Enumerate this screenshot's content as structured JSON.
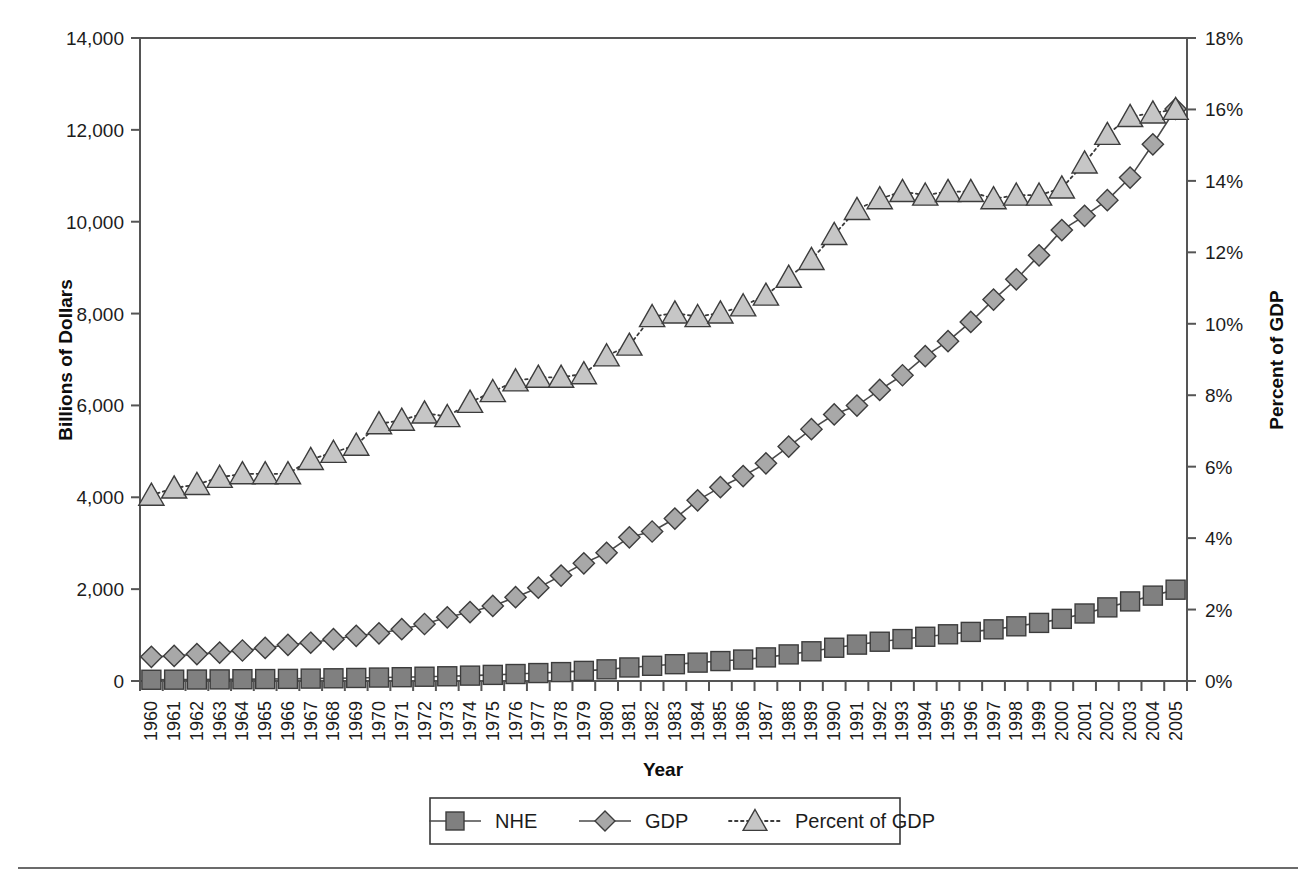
{
  "chart_data": {
    "type": "line",
    "title": "",
    "xlabel": "Year",
    "ylabel": "Billions of Dollars",
    "y2label": "Percent of GDP",
    "grid": false,
    "legend_position": "bottom",
    "ylim": [
      0,
      14000
    ],
    "y2lim": [
      0,
      18
    ],
    "yticks": [
      "0",
      "2,000",
      "4,000",
      "6,000",
      "8,000",
      "10,000",
      "12,000",
      "14,000"
    ],
    "ytick_values": [
      0,
      2000,
      4000,
      6000,
      8000,
      10000,
      12000,
      14000
    ],
    "y2ticks": [
      "0%",
      "2%",
      "4%",
      "6%",
      "8%",
      "10%",
      "12%",
      "14%",
      "16%",
      "18%"
    ],
    "y2tick_values": [
      0,
      2,
      4,
      6,
      8,
      10,
      12,
      14,
      16,
      18
    ],
    "categories": [
      "1960",
      "1961",
      "1962",
      "1963",
      "1964",
      "1965",
      "1966",
      "1967",
      "1968",
      "1969",
      "1970",
      "1971",
      "1972",
      "1973",
      "1974",
      "1975",
      "1976",
      "1977",
      "1978",
      "1979",
      "1980",
      "1981",
      "1982",
      "1983",
      "1984",
      "1985",
      "1986",
      "1987",
      "1988",
      "1989",
      "1990",
      "1991",
      "1992",
      "1993",
      "1994",
      "1995",
      "1996",
      "1997",
      "1998",
      "1999",
      "2000",
      "2001",
      "2002",
      "2003",
      "2004",
      "2005"
    ],
    "series": [
      {
        "name": "NHE",
        "marker": "square",
        "line_style": "solid",
        "color": "#808080",
        "axis": "left",
        "units": "Billions of Dollars",
        "values": [
          27,
          29,
          32,
          35,
          39,
          42,
          46,
          52,
          59,
          66,
          75,
          83,
          93,
          103,
          117,
          133,
          152,
          173,
          194,
          220,
          254,
          295,
          331,
          366,
          400,
          434,
          467,
          514,
          579,
          647,
          724,
          792,
          855,
          913,
          963,
          1017,
          1069,
          1125,
          1191,
          1265,
          1353,
          1470,
          1603,
          1733,
          1859,
          1988
        ]
      },
      {
        "name": "GDP",
        "marker": "diamond",
        "line_style": "solid",
        "color": "#a8a8a8",
        "axis": "left",
        "units": "Billions of Dollars",
        "values": [
          526,
          545,
          586,
          618,
          664,
          719,
          788,
          833,
          910,
          985,
          1039,
          1128,
          1241,
          1386,
          1501,
          1635,
          1824,
          2031,
          2295,
          2563,
          2790,
          3128,
          3255,
          3537,
          3933,
          4220,
          4463,
          4739,
          5104,
          5484,
          5803,
          5996,
          6338,
          6657,
          7072,
          7398,
          7817,
          8304,
          8747,
          9268,
          9817,
          10128,
          10470,
          10961,
          11686,
          12456
        ]
      },
      {
        "name": "Percent of GDP",
        "marker": "triangle",
        "line_style": "dotted",
        "color": "#c6c6c6",
        "axis": "right",
        "units": "Percent of GDP",
        "values": [
          5.2,
          5.4,
          5.5,
          5.7,
          5.8,
          5.8,
          5.8,
          6.2,
          6.4,
          6.6,
          7.2,
          7.3,
          7.5,
          7.4,
          7.8,
          8.1,
          8.4,
          8.5,
          8.5,
          8.6,
          9.1,
          9.4,
          10.2,
          10.3,
          10.2,
          10.3,
          10.5,
          10.8,
          11.3,
          11.8,
          12.5,
          13.2,
          13.5,
          13.7,
          13.6,
          13.7,
          13.7,
          13.5,
          13.6,
          13.6,
          13.8,
          14.5,
          15.3,
          15.8,
          15.9,
          16.0
        ]
      }
    ]
  },
  "axis": {
    "left_title": "Billions of Dollars",
    "right_title": "Percent of GDP",
    "x_title": "Year"
  },
  "legend": {
    "items": [
      {
        "label": "NHE",
        "marker": "square-marker-icon",
        "style": "solid"
      },
      {
        "label": "GDP",
        "marker": "diamond-marker-icon",
        "style": "solid"
      },
      {
        "label": "Percent of GDP",
        "marker": "triangle-marker-icon",
        "style": "dotted"
      }
    ]
  },
  "colors": {
    "nhe": "#808080",
    "gdp": "#a8a8a8",
    "percent": "#c6c6c6",
    "axis": "#555555",
    "text": "#1c1c1c",
    "background": "#ffffff"
  }
}
